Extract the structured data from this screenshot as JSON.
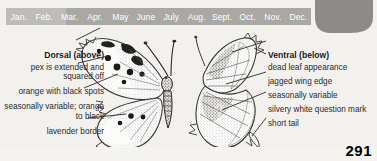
{
  "page": {
    "number": "291",
    "background_color": "#f2f1ee"
  },
  "flight_bar": {
    "name": "flight-period-bar",
    "bar_color": "#bdbcb8",
    "season_band_color": "#a9a8a4",
    "label_color": "#ffffff",
    "months": [
      "Jan.",
      "Feb.",
      "Mar.",
      "Apr.",
      "May",
      "June",
      "July",
      "Aug.",
      "Sept.",
      "Oct.",
      "Nov.",
      "Dec."
    ],
    "active_from": "Apr.",
    "active_to": "Dec."
  },
  "range_map": {
    "name": "range-map",
    "fill_color": "#8c8b87"
  },
  "dorsal": {
    "heading": "Dorsal (above)",
    "callouts": [
      "pex is extended and squared off",
      "orange with black spots",
      "seasonally variable; orange to black",
      "lavender border"
    ]
  },
  "ventral": {
    "heading": "Ventral (below)",
    "callouts": [
      "dead leaf appearance",
      "jagged wing edge",
      "seasonally variable",
      "silvery white question mark",
      "short tail"
    ]
  },
  "illustrations": {
    "dorsal_figure_name": "butterfly-dorsal-illustration",
    "ventral_figure_name": "butterfly-ventral-illustration"
  }
}
